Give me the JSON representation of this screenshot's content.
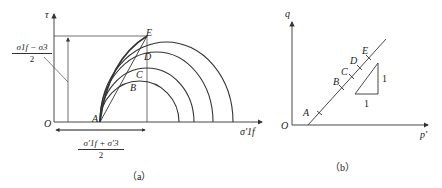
{
  "panel_a": {
    "y_axis_label": "τ",
    "x_axis_label": "σ'1f",
    "origin_label": "O",
    "points": [
      "A",
      "B",
      "C",
      "D",
      "E"
    ],
    "top_fraction": {
      "numerator": "σ1f − σ3",
      "denominator": "2"
    },
    "bottom_fraction": {
      "numerator": "σ'1f + σ'3",
      "denominator": "2"
    },
    "caption": "（a）"
  },
  "panel_b": {
    "y_axis_label": "q",
    "x_axis_label": "p'",
    "origin_label": "O",
    "points": [
      "A",
      "B",
      "C",
      "D",
      "E"
    ],
    "slope_triangle": {
      "rise": "1",
      "run": "1"
    },
    "caption": "（b）"
  }
}
